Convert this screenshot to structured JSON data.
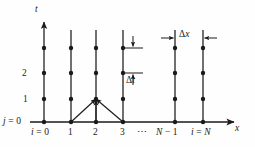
{
  "figure": {
    "kind": "finite-difference-space-time-grid",
    "axes": {
      "x_axis_label": "x",
      "y_axis_label": "t",
      "origin_row_label": "j = 0",
      "origin_col_label": "i = 0"
    },
    "x_tick_labels": [
      "i = 0",
      "1",
      "2",
      "3",
      "⋯",
      "N − 1",
      "i = N"
    ],
    "y_tick_labels": [
      "1",
      "2"
    ],
    "annotations": {
      "delta_t": "Δt",
      "delta_x": "Δx"
    },
    "grid": {
      "columns": 6,
      "time_levels": 4,
      "node_count_per_column": 4
    },
    "stencil": {
      "apex_column": 2,
      "apex_level": 1,
      "base_columns": [
        1,
        2,
        3
      ],
      "base_level": 0,
      "arrow_count": 3
    },
    "colors": {
      "ink": "#1a1a1a",
      "background": "#fefefe"
    }
  }
}
